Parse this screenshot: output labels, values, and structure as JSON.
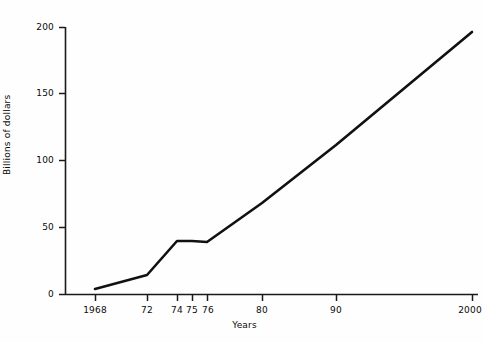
{
  "chart_data": {
    "type": "line",
    "title": "",
    "subtitle": "",
    "xlabel": "Years",
    "ylabel": "Billions of dollars",
    "x": [
      1968,
      1972,
      1974,
      1975,
      1976,
      1980,
      1990,
      2000
    ],
    "values": [
      5,
      14,
      41,
      40,
      40,
      68,
      112,
      196
    ],
    "series": [
      {
        "name": "",
        "values": [
          5,
          14,
          41,
          40,
          40,
          68,
          112,
          196
        ]
      }
    ],
    "xtick_labels": [
      "1968",
      "72",
      "74",
      "75",
      "76",
      "80",
      "90",
      "2000"
    ],
    "xtick_values": [
      1968,
      1972,
      1974,
      1975,
      1976,
      1980,
      1990,
      2000
    ],
    "ytick_labels": [
      "0",
      "50",
      "100",
      "150",
      "200"
    ],
    "ytick_values": [
      0,
      50,
      100,
      150,
      200
    ],
    "ylim": [
      0,
      200
    ],
    "xlim": [
      1968,
      2000
    ],
    "grid": false,
    "legend": false,
    "legend_position": "none",
    "line_color": "#111111",
    "background_color": "#fefefe",
    "axis_color": "#1a1a1a",
    "annotations": []
  },
  "axis": {
    "y_title": "Billions of dollars",
    "x_title": "Years"
  },
  "ticks": {
    "y": [
      {
        "label": "200",
        "px_y": 27
      },
      {
        "label": "150",
        "px_y": 93
      },
      {
        "label": "100",
        "px_y": 160
      },
      {
        "label": "50",
        "px_y": 227
      },
      {
        "label": "0",
        "px_y": 294
      }
    ],
    "x": [
      {
        "label": "1968",
        "px_x": 95
      },
      {
        "label": "72",
        "px_x": 147
      },
      {
        "label": "74",
        "px_x": 177
      },
      {
        "label": "75",
        "px_x": 192
      },
      {
        "label": "76",
        "px_x": 207
      },
      {
        "label": "80",
        "px_x": 262
      },
      {
        "label": "90",
        "px_x": 336
      },
      {
        "label": "2000",
        "px_x": 472
      }
    ]
  },
  "geometry": {
    "axis_x_px": 65,
    "baseline_y_px": 294,
    "top_y_px": 27,
    "right_px": 478,
    "line_points_px": [
      [
        95,
        289
      ],
      [
        147,
        275
      ],
      [
        177,
        241
      ],
      [
        192,
        241
      ],
      [
        207,
        242
      ],
      [
        262,
        203
      ],
      [
        336,
        145
      ],
      [
        472,
        32
      ]
    ]
  }
}
